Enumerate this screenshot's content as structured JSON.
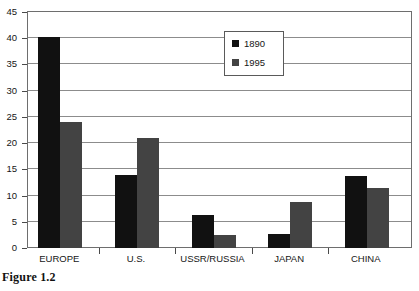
{
  "caption": "Figure 1.2",
  "legend": {
    "position": "top-center",
    "entries": [
      {
        "label": "1890",
        "color": "#111111"
      },
      {
        "label": "1995",
        "color": "#434343"
      }
    ]
  },
  "axes": {
    "y_ticks": [
      "0",
      "5",
      "10",
      "15",
      "20",
      "25",
      "30",
      "35",
      "40",
      "45"
    ],
    "x_ticks": [
      "EUROPE",
      "U.S.",
      "USSR/RUSSIA",
      "JAPAN",
      "CHINA"
    ]
  },
  "chart_data": {
    "type": "bar",
    "title": "",
    "xlabel": "",
    "ylabel": "",
    "ylim": [
      0,
      45
    ],
    "ytick_step": 5,
    "grid": true,
    "legend_position": "top-center",
    "categories": [
      "EUROPE",
      "U.S.",
      "USSR/RUSSIA",
      "JAPAN",
      "CHINA"
    ],
    "series": [
      {
        "name": "1890",
        "color": "#111111",
        "values": [
          40.3,
          14.0,
          6.3,
          2.7,
          13.7
        ]
      },
      {
        "name": "1995",
        "color": "#434343",
        "values": [
          24.0,
          21.0,
          2.5,
          8.7,
          11.5
        ]
      }
    ]
  }
}
